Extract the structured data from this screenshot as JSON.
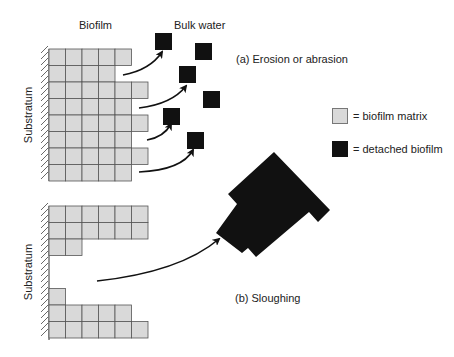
{
  "labels": {
    "biofilm": "Biofilm",
    "bulk_water": "Bulk water",
    "substratum_top": "Substratum",
    "substratum_bottom": "Substratum",
    "panel_a": "(a) Erosion or abrasion",
    "panel_b": "(b) Sloughing"
  },
  "legend": {
    "items": [
      {
        "label": "= biofilm matrix",
        "color": "#d9d9d9",
        "border": "#777777"
      },
      {
        "label": "= detached biofilm",
        "color": "#111111",
        "border": "#111111"
      }
    ]
  },
  "colors": {
    "matrix_fill": "#d9d9d9",
    "matrix_stroke": "#555555",
    "detached": "#111111",
    "arrow": "#111111",
    "text": "#222222"
  },
  "diagram": {
    "cell_size": 16.5,
    "panel_a": {
      "origin": [
        49,
        49
      ],
      "row_lengths": [
        5,
        4,
        6,
        5,
        6,
        5,
        6,
        5
      ],
      "wall": {
        "x": 49,
        "y1": 49,
        "y2": 181
      },
      "detached_squares": [
        [
          155,
          33
        ],
        [
          195,
          43
        ],
        [
          179,
          66
        ],
        [
          203,
          91
        ],
        [
          163,
          108
        ],
        [
          187,
          132
        ]
      ],
      "arrows": [
        {
          "from": [
            123,
            75
          ],
          "ctrl": [
            150,
            70
          ],
          "to": [
            162,
            52
          ]
        },
        {
          "from": [
            139,
            108
          ],
          "ctrl": [
            172,
            104
          ],
          "to": [
            186,
            86
          ]
        },
        {
          "from": [
            147,
            140
          ],
          "ctrl": [
            164,
            137
          ],
          "to": [
            171,
            124
          ]
        },
        {
          "from": [
            139,
            172
          ],
          "ctrl": [
            182,
            170
          ],
          "to": [
            193,
            150
          ]
        }
      ]
    },
    "panel_b": {
      "origin": [
        49,
        206
      ],
      "rows": [
        [
          0,
          6
        ],
        [
          0,
          6
        ],
        [
          0,
          2
        ],
        [
          0,
          0
        ],
        [
          0,
          0
        ],
        [
          0,
          1
        ],
        [
          0,
          5
        ],
        [
          0,
          6
        ]
      ],
      "wall": {
        "x": 49,
        "y1": 206,
        "y2": 340
      },
      "detached_polygon": [
        [
          274,
          152
        ],
        [
          330,
          210
        ],
        [
          318,
          222
        ],
        [
          309,
          212
        ],
        [
          256,
          257
        ],
        [
          248,
          248
        ],
        [
          242,
          253
        ],
        [
          216,
          233
        ],
        [
          237,
          204
        ],
        [
          228,
          194
        ]
      ],
      "arrow": {
        "from": [
          97,
          281
        ],
        "ctrl": [
          180,
          272
        ],
        "to": [
          219,
          239
        ]
      }
    }
  }
}
